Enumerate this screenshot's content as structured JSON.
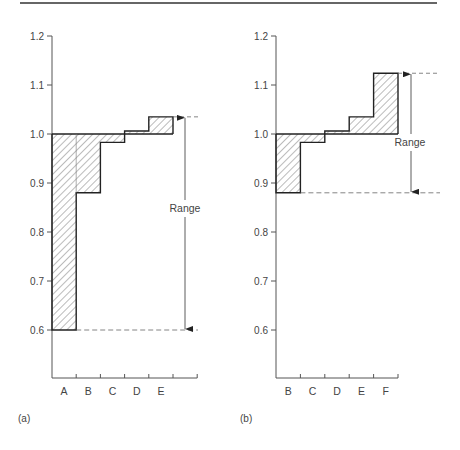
{
  "figure": {
    "panels": [
      {
        "id": "a",
        "label": "(a)"
      },
      {
        "id": "b",
        "label": "(b)"
      }
    ],
    "range_label": "Range"
  },
  "chart_data": [
    {
      "type": "bar",
      "subtype": "step-deviation-from-baseline",
      "panel": "(a)",
      "title": "",
      "xlabel": "",
      "ylabel": "",
      "baseline": 1.0,
      "categories": [
        "A",
        "B",
        "C",
        "D",
        "E"
      ],
      "values": [
        0.6,
        0.88,
        0.983,
        1.006,
        1.035
      ],
      "ylim": [
        0.5,
        1.2
      ],
      "yticks": [
        0.6,
        0.7,
        0.8,
        0.9,
        1.0,
        1.1,
        1.2
      ],
      "ytick_labels": [
        "0.6",
        "0.7",
        "0.8",
        "0.9",
        "1.0",
        "1.1",
        "1.2"
      ],
      "fill": "hatched",
      "grid": false,
      "annotations": [
        {
          "text": "Range",
          "from": 0.6,
          "to": 1.035,
          "type": "double-arrow"
        }
      ]
    },
    {
      "type": "bar",
      "subtype": "step-deviation-from-baseline",
      "panel": "(b)",
      "title": "",
      "xlabel": "",
      "ylabel": "",
      "baseline": 1.0,
      "categories": [
        "B",
        "C",
        "D",
        "E",
        "F"
      ],
      "values": [
        0.88,
        0.983,
        1.006,
        1.035,
        1.124
      ],
      "ylim": [
        0.5,
        1.2
      ],
      "yticks": [
        0.6,
        0.7,
        0.8,
        0.9,
        1.0,
        1.1,
        1.2
      ],
      "ytick_labels": [
        "0.6",
        "0.7",
        "0.8",
        "0.9",
        "1.0",
        "1.1",
        "1.2"
      ],
      "fill": "hatched",
      "grid": false,
      "annotations": [
        {
          "text": "Range",
          "from": 0.88,
          "to": 1.124,
          "type": "double-arrow"
        }
      ]
    }
  ]
}
